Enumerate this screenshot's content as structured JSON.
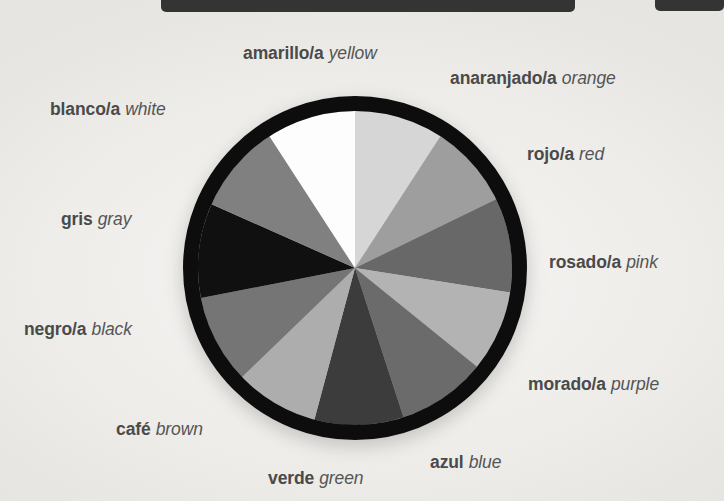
{
  "page": {
    "background_color": "#f2f1ef",
    "topbars": [
      {
        "name": "top-bar-left",
        "color": "#343434"
      },
      {
        "name": "top-bar-right",
        "color": "#343434"
      }
    ]
  },
  "diagram": {
    "center_x": 355,
    "center_y": 268,
    "radius": 172,
    "ring_color": "#0d0d0d",
    "ring_width": 15
  },
  "chart_data": {
    "type": "pie",
    "legend_position": "around",
    "categories": [
      "amarillo/a",
      "anaranjado/a",
      "rojo/a",
      "rosado/a",
      "morado/a",
      "azul",
      "verde",
      "café",
      "negro/a",
      "gris",
      "blanco/a"
    ],
    "values": [
      33,
      31,
      35,
      30,
      33,
      33,
      31,
      33,
      35,
      33,
      33
    ],
    "xlabel": "",
    "ylabel": ""
  },
  "segments": [
    {
      "id": "amarillo",
      "spanish": "amarillo/a",
      "english": "yellow",
      "swatch": "#d6d6d6",
      "start_deg": -90,
      "end_deg": -57
    },
    {
      "id": "anaranjado",
      "spanish": "anaranjado/a",
      "english": "orange",
      "swatch": "#9e9e9e",
      "start_deg": -57,
      "end_deg": -26
    },
    {
      "id": "rojo",
      "spanish": "rojo/a",
      "english": "red",
      "swatch": "#686868",
      "start_deg": -26,
      "end_deg": 9
    },
    {
      "id": "rosado",
      "spanish": "rosado/a",
      "english": "pink",
      "swatch": "#b3b3b3",
      "start_deg": 9,
      "end_deg": 39
    },
    {
      "id": "morado",
      "spanish": "morado/a",
      "english": "purple",
      "swatch": "#6b6b6b",
      "start_deg": 39,
      "end_deg": 72
    },
    {
      "id": "azul",
      "spanish": "azul",
      "english": "blue",
      "swatch": "#3c3c3c",
      "start_deg": 72,
      "end_deg": 105
    },
    {
      "id": "verde",
      "spanish": "verde",
      "english": "green",
      "swatch": "#adadad",
      "start_deg": 105,
      "end_deg": 136
    },
    {
      "id": "cafe",
      "spanish": "café",
      "english": "brown",
      "swatch": "#757575",
      "start_deg": 136,
      "end_deg": 169
    },
    {
      "id": "negro",
      "spanish": "negro/a",
      "english": "black",
      "swatch": "#101010",
      "start_deg": 169,
      "end_deg": 204
    },
    {
      "id": "gris",
      "spanish": "gris",
      "english": "gray",
      "swatch": "#808080",
      "start_deg": 204,
      "end_deg": 237
    },
    {
      "id": "blanco",
      "spanish": "blanco/a",
      "english": "white",
      "swatch": "#fdfdfd",
      "start_deg": 237,
      "end_deg": 270
    }
  ]
}
